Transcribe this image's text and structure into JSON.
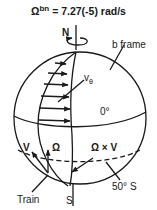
{
  "title": {
    "symbol": "Ω",
    "superscript": "bn",
    "value_text": " = 7.27(-5) rad/s"
  },
  "labels": {
    "north": "N",
    "south": "S",
    "frame": "b frame",
    "velocity_profile": "v",
    "velocity_subscript": "θ",
    "equator": "0°",
    "latitude": "50° S",
    "train": "Train",
    "v_vector": "V",
    "omega_vector": "Ω",
    "coriolis": "Ω × V"
  },
  "colors": {
    "ink": "#1a1a1a",
    "background": "#ffffff"
  }
}
